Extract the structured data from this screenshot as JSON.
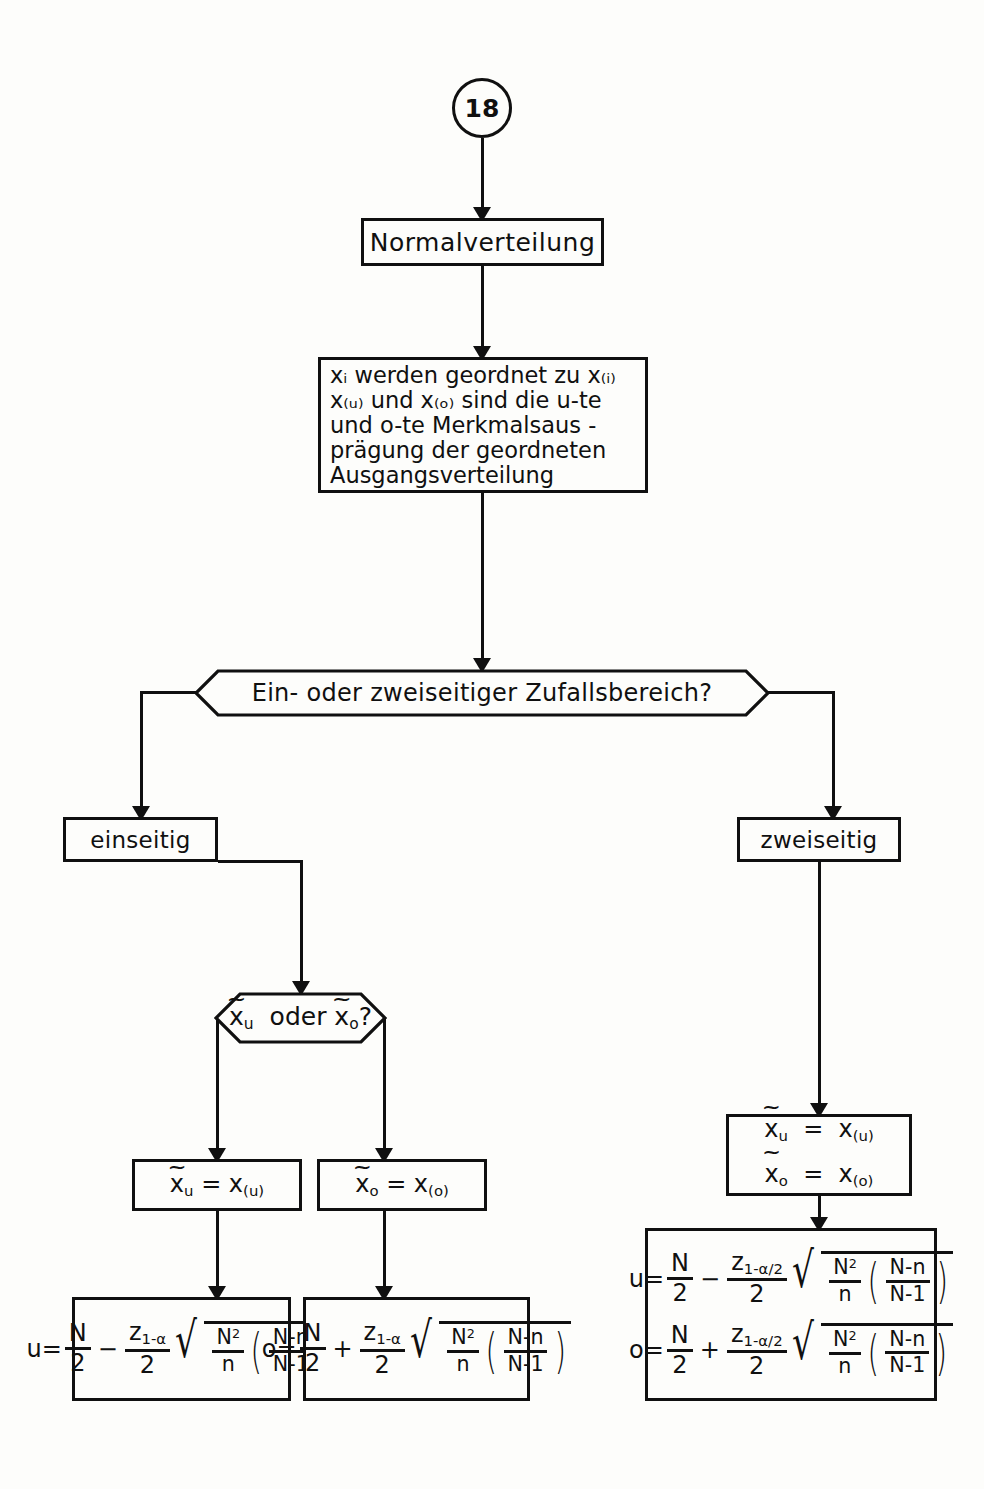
{
  "diagram": {
    "page_connector": "18",
    "nodes": {
      "start_box": "Normalverteilung",
      "description_lines": [
        "xᵢ werden geordnet zu x₍ᵢ₎",
        "x₍ᵤ₎ und x₍ₒ₎ sind die u-te",
        "und o-te Merkmalsaus -",
        "prägung der geordneten",
        "Ausgangsverteilung"
      ],
      "description_plain": "xi werden geordnet zu x(i) / x(u) und x(o) sind die u-te und o-te Merkmalsauspraegung der geordneten Ausgangsverteilung",
      "decision_1": "Ein- oder zweiseitiger Zufallsbereich?",
      "branch_left": "einseitig",
      "branch_right": "zweiseitig",
      "decision_2": "x̃u oder x̃o?",
      "assign_left": "x̃u = x(u)",
      "assign_right": "x̃o = x(o)",
      "assign_both_line1": "x̃u = x(u)",
      "assign_both_line2": "x̃o = x(o)"
    },
    "formulas": {
      "left": {
        "lhs": "u=",
        "op": "−",
        "z": "z₁₋α",
        "text": "u = N/2 − (z₁₋α / 2) √( N²/n · ((N−n)/(N−1)) )"
      },
      "middle": {
        "lhs": "o=",
        "op": "+",
        "z": "z₁₋α",
        "text": "o = N/2 + (z₁₋α / 2) √( N²/n · ((N−n)/(N−1)) )"
      },
      "right_u": {
        "lhs": "u=",
        "op": "−",
        "z": "z₁₋α/₂",
        "text": "u = N/2 − (z₁₋αᐟ₂ / 2) √( N²/n · ((N−n)/(N−1)) )"
      },
      "right_o": {
        "lhs": "o=",
        "op": "+",
        "z": "z₁₋α/₂",
        "text": "o = N/2 + (z₁₋αᐟ₂ / 2) √( N²/n · ((N−n)/(N−1)) )"
      },
      "symbols": {
        "N": "N",
        "n": "n",
        "two": "2",
        "N_sq": "N²",
        "N_minus_n": "N-n",
        "N_minus_1": "N-1",
        "z_base": "z",
        "z_sub_one_sided": "1-α",
        "z_sub_two_sided": "1-α/2"
      }
    },
    "colors": {
      "ink": "#101010",
      "paper": "#fdfdfb"
    }
  }
}
